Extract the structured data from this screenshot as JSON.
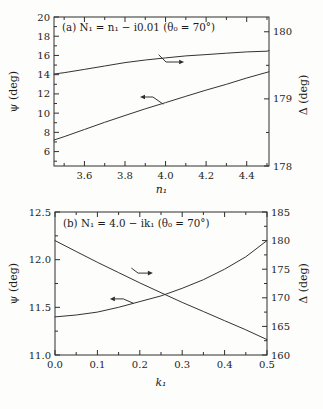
{
  "figure": {
    "background": "#fdfdfb",
    "line_color": "#2e2e2e",
    "text_color": "#1c1c1c"
  },
  "chart_data": [
    {
      "type": "line",
      "id": "a",
      "title": "(a) N₁ = n₁ − i0.01 (θ₀ = 70°)",
      "xlabel": "n₁",
      "ylabel_left": "ψ (deg)",
      "ylabel_right": "Δ (deg)",
      "xlim": [
        3.45,
        4.51
      ],
      "xticks": [
        3.6,
        3.8,
        4.0,
        4.2,
        4.4
      ],
      "xtick_labels": [
        "3.6",
        "3.8",
        "4.0",
        "4.2",
        "4.4"
      ],
      "xminor": [
        3.5,
        3.7,
        3.9,
        4.1,
        4.3,
        4.5
      ],
      "ylim_left": [
        4.5,
        20
      ],
      "yticks_left": [
        20,
        18,
        16,
        14,
        12,
        10,
        8,
        6
      ],
      "ytick_left_labels": [
        "20",
        "18",
        "16",
        "14",
        "12",
        "10",
        "8",
        "6"
      ],
      "yminor_left": [
        5,
        7,
        9,
        11,
        13,
        15,
        17,
        19
      ],
      "ylim_right": [
        178,
        180.22
      ],
      "yticks_right": [
        180,
        179,
        178
      ],
      "ytick_right_labels": [
        "180",
        "179",
        "178"
      ],
      "yminor_right": [
        178.5,
        179.5
      ],
      "grid": false,
      "frame": {
        "left": 54,
        "top": 17,
        "width": 215,
        "height": 149
      },
      "series": [
        {
          "name": "psi",
          "axis": "left",
          "x": [
            3.45,
            3.5,
            3.6,
            3.7,
            3.8,
            3.9,
            4.0,
            4.1,
            4.2,
            4.3,
            4.4,
            4.5,
            4.51
          ],
          "y": [
            7.2,
            7.55,
            8.3,
            9.05,
            9.75,
            10.45,
            11.1,
            11.75,
            12.4,
            13.0,
            13.65,
            14.25,
            14.3
          ]
        },
        {
          "name": "delta",
          "axis": "right",
          "x": [
            3.45,
            3.5,
            3.6,
            3.7,
            3.8,
            3.9,
            4.0,
            4.1,
            4.2,
            4.3,
            4.4,
            4.5,
            4.51
          ],
          "y": [
            179.37,
            179.39,
            179.44,
            179.49,
            179.54,
            179.58,
            179.61,
            179.64,
            179.66,
            179.68,
            179.7,
            179.71,
            179.72
          ]
        }
      ],
      "arrows": [
        {
          "dir": "right",
          "target": "delta",
          "points_frac": [
            [
              0.488,
              0.255
            ],
            [
              0.521,
              0.302
            ],
            [
              0.605,
              0.302
            ]
          ]
        },
        {
          "dir": "left",
          "target": "psi",
          "points_frac": [
            [
              0.507,
              0.584
            ],
            [
              0.46,
              0.537
            ],
            [
              0.4,
              0.537
            ]
          ]
        }
      ]
    },
    {
      "type": "line",
      "id": "b",
      "title": "(b) N₁ = 4.0 − ik₁ (θ₀ = 70°)",
      "xlabel": "k₁",
      "ylabel_left": "ψ (deg)",
      "ylabel_right": "Δ (deg)",
      "xlim": [
        0,
        0.5
      ],
      "xticks": [
        0.0,
        0.1,
        0.2,
        0.3,
        0.4,
        0.5
      ],
      "xtick_labels": [
        "0.0",
        "0.1",
        "0.2",
        "0.3",
        "0.4",
        "0.5"
      ],
      "xminor": [
        0.05,
        0.15,
        0.25,
        0.35,
        0.45
      ],
      "ylim_left": [
        11.0,
        12.5
      ],
      "yticks_left": [
        12.5,
        12.0,
        11.5,
        11.0
      ],
      "ytick_left_labels": [
        "12.5",
        "12.0",
        "11.5",
        "11.0"
      ],
      "yminor_left": [
        11.25,
        11.75,
        12.25
      ],
      "ylim_right": [
        160,
        185
      ],
      "yticks_right": [
        185,
        180,
        175,
        170,
        165,
        160
      ],
      "ytick_right_labels": [
        "185",
        "180",
        "175",
        "170",
        "165",
        "160"
      ],
      "yminor_right": [
        162.5,
        167.5,
        172.5,
        177.5,
        182.5
      ],
      "grid": false,
      "frame": {
        "left": 55,
        "top": 212,
        "width": 212,
        "height": 143
      },
      "series": [
        {
          "name": "psi",
          "axis": "left",
          "x": [
            0,
            0.05,
            0.1,
            0.15,
            0.2,
            0.25,
            0.3,
            0.35,
            0.4,
            0.45,
            0.5
          ],
          "y": [
            11.4,
            11.42,
            11.45,
            11.5,
            11.56,
            11.62,
            11.7,
            11.79,
            11.9,
            12.03,
            12.2
          ]
        },
        {
          "name": "delta",
          "axis": "right",
          "x": [
            0,
            0.05,
            0.1,
            0.15,
            0.2,
            0.25,
            0.3,
            0.35,
            0.4,
            0.45,
            0.5
          ],
          "y": [
            180.0,
            178.1,
            176.2,
            174.4,
            172.6,
            170.9,
            169.2,
            167.6,
            166.0,
            164.4,
            162.7
          ]
        }
      ],
      "arrows": [
        {
          "dir": "right",
          "target": "delta",
          "points_frac": [
            [
              0.362,
              0.394
            ],
            [
              0.392,
              0.427
            ],
            [
              0.462,
              0.427
            ]
          ]
        },
        {
          "dir": "left",
          "target": "psi",
          "points_frac": [
            [
              0.369,
              0.638
            ],
            [
              0.322,
              0.608
            ],
            [
              0.259,
              0.608
            ]
          ]
        }
      ]
    }
  ]
}
